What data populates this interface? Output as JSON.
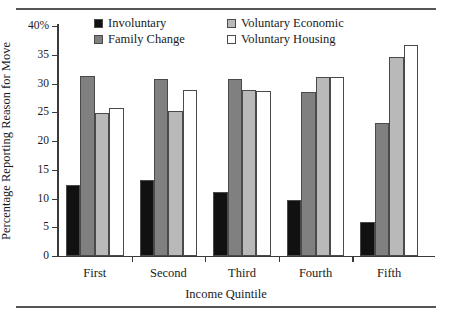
{
  "chart_data": {
    "type": "bar",
    "title": "",
    "xlabel": "Income Quintile",
    "ylabel": "Percentage Reporting Reason for Move",
    "categories": [
      "First",
      "Second",
      "Third",
      "Fourth",
      "Fifth"
    ],
    "ylim": [
      0,
      40
    ],
    "ytick_values": [
      0,
      5,
      10,
      15,
      20,
      25,
      30,
      35,
      40
    ],
    "ytick_labels": [
      "0",
      "5",
      "10",
      "15",
      "20",
      "25",
      "30",
      "35",
      "40%"
    ],
    "grid": false,
    "legend_position": "top-center",
    "series": [
      {
        "name": "Involuntary",
        "color": "#111111",
        "values": [
          12.4,
          13.3,
          11.2,
          9.7,
          6.0
        ]
      },
      {
        "name": "Family Change",
        "color": "#808080",
        "values": [
          31.3,
          30.8,
          30.8,
          28.5,
          23.1
        ]
      },
      {
        "name": "Voluntary Economic",
        "color": "#b9b9b9",
        "values": [
          24.9,
          25.2,
          28.9,
          31.1,
          34.6
        ]
      },
      {
        "name": "Voluntary Housing",
        "color": "#ffffff",
        "values": [
          25.7,
          28.8,
          28.7,
          31.1,
          36.7
        ]
      }
    ]
  }
}
